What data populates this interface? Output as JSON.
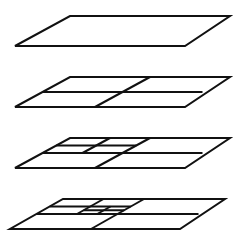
{
  "diagram": {
    "type": "recursive-quadtree-subdivision",
    "stroke_color": "#111111",
    "background": "#ffffff",
    "planes": [
      {
        "name": "level-0",
        "corners": {
          "tl": [
            70,
            16
          ],
          "tr": [
            230,
            16
          ],
          "br": [
            185,
            46
          ],
          "bl": [
            15,
            46
          ]
        },
        "divisions": []
      },
      {
        "name": "level-1",
        "corners": {
          "tl": [
            70,
            77
          ],
          "tr": [
            230,
            77
          ],
          "br": [
            185,
            107
          ],
          "bl": [
            15,
            107
          ]
        },
        "divisions": [
          [
            [
              0.5,
              0
            ],
            [
              0.5,
              1
            ]
          ],
          [
            [
              0,
              0.5
            ],
            [
              1,
              0.5
            ]
          ]
        ]
      },
      {
        "name": "level-2",
        "corners": {
          "tl": [
            70,
            138
          ],
          "tr": [
            230,
            138
          ],
          "br": [
            185,
            168
          ],
          "bl": [
            15,
            168
          ]
        },
        "divisions": [
          [
            [
              0.5,
              0
            ],
            [
              0.5,
              1
            ]
          ],
          [
            [
              0,
              0.5
            ],
            [
              1,
              0.5
            ]
          ],
          [
            [
              0.25,
              0
            ],
            [
              0.25,
              0.5
            ]
          ],
          [
            [
              0,
              0.25
            ],
            [
              0.5,
              0.25
            ]
          ]
        ]
      },
      {
        "name": "level-3",
        "corners": {
          "tl": [
            63,
            199
          ],
          "tr": [
            225,
            199
          ],
          "br": [
            180,
            229
          ],
          "bl": [
            10,
            229
          ]
        },
        "divisions": [
          [
            [
              0.5,
              0
            ],
            [
              0.5,
              1
            ]
          ],
          [
            [
              0,
              0.5
            ],
            [
              1,
              0.5
            ]
          ],
          [
            [
              0.25,
              0
            ],
            [
              0.25,
              0.5
            ]
          ],
          [
            [
              0,
              0.25
            ],
            [
              0.5,
              0.25
            ]
          ],
          [
            [
              0.375,
              0.25
            ],
            [
              0.375,
              0.5
            ]
          ],
          [
            [
              0.25,
              0.375
            ],
            [
              0.5,
              0.375
            ]
          ]
        ]
      }
    ]
  }
}
